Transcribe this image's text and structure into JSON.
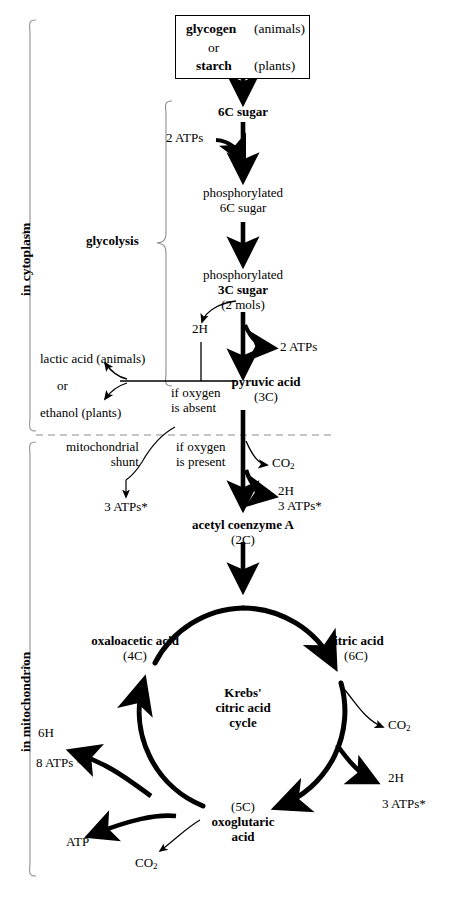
{
  "diagram": {
    "compartments": [
      {
        "id": "cytoplasm",
        "label": "in cytoplasm"
      },
      {
        "id": "mitochondrion",
        "label": "in mitochondrion"
      }
    ],
    "brackets": [
      {
        "id": "glycolysis",
        "label": "glycolysis"
      }
    ],
    "source_box": {
      "line1_bold": "glycogen",
      "line1_plain": "(animals)",
      "line2": "or",
      "line3_bold": "starch",
      "line3_plain": "(plants)"
    },
    "nodes": {
      "six_c_sugar": "6C sugar",
      "phos_6c_line1": "phosphorylated",
      "phos_6c_line2": "6C sugar",
      "phos_3c_line1": "phosphorylated",
      "phos_3c_line2": "3C sugar",
      "phos_3c_line3": "(2 mols)",
      "pyruvic_line1": "pyruvic acid",
      "pyruvic_line2": "(3C)",
      "acetyl_line1": "acetyl coenzyme A",
      "acetyl_line2": "(2C)",
      "citric_line1": "citric acid",
      "citric_line2": "(6C)",
      "oxaloacetic_line1": "oxaloacetic acid",
      "oxaloacetic_line2": "(4C)",
      "oxoglutaric_line1": "(5C)",
      "oxoglutaric_line2": "oxoglutaric",
      "oxoglutaric_line3": "acid",
      "krebs_line1": "Krebs'",
      "krebs_line2": "citric acid",
      "krebs_line3": "cycle"
    },
    "side_products": {
      "two_atps_in": "2 ATPs",
      "two_atps_out": "2 ATPs",
      "two_h_glyc": "2H",
      "lactic_acid": "lactic acid (animals)",
      "or": "or",
      "ethanol": "ethanol (plants)",
      "if_oxygen_absent_line1": "if oxygen",
      "if_oxygen_absent_line2": "is absent",
      "if_oxygen_present_line1": "if oxygen",
      "if_oxygen_present_line2": "is present",
      "mito_shunt_line1": "mitochondrial",
      "mito_shunt_line2": "shunt",
      "shunt_atps": "3 ATPs*",
      "co2_acetyl": "CO2",
      "two_h_acetyl": "2H",
      "three_atps_acetyl": "3 ATPs*",
      "co2_citric": "CO2",
      "two_h_krebs": "2H",
      "three_atps_krebs": "3 ATPs*",
      "six_h_krebs": "6H",
      "eight_atps_krebs": "8 ATPs *",
      "atp_substrate": "ATP",
      "co2_oxoglutaric": "CO2"
    }
  },
  "style": {
    "ink": "#000000",
    "paper": "#ffffff",
    "rule": "#9a9a9a"
  }
}
